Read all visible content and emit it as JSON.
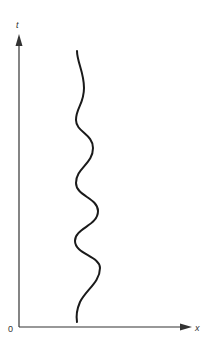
{
  "diagram": {
    "type": "spacetime-worldline",
    "axes": {
      "x_label": "x",
      "t_label": "t",
      "origin_label": "0"
    },
    "colors": {
      "axis": "#333333",
      "curve": "#1a1a1a",
      "background": "#ffffff"
    },
    "worldline": {
      "description": "wavy vertical curve oscillating left and right as t increases",
      "oscillations": 4
    }
  }
}
